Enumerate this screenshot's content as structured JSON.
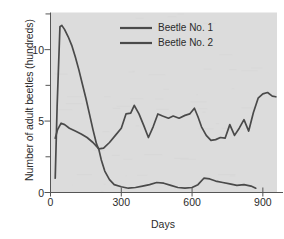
{
  "chart_data": {
    "type": "line",
    "title": "",
    "xlabel": "Days",
    "ylabel": "Number of adult beetles (hundreds)",
    "xlim": [
      0,
      960
    ],
    "ylim": [
      0,
      12.6
    ],
    "xticks": [
      0,
      300,
      600,
      900
    ],
    "xtick_labels": [
      "0",
      "300",
      "600",
      "900"
    ],
    "yticks": [
      0,
      5,
      10
    ],
    "ytick_labels": [
      "0",
      "5",
      "10"
    ],
    "yminor_ticks": [
      2.5,
      7.5,
      12.5
    ],
    "grid": false,
    "legend_position": "top-center",
    "plot_background": "#dcdcdc",
    "line_color": "#4a4a4a",
    "series": [
      {
        "name": "Beetle No. 1",
        "color": "#4a4a4a",
        "x": [
          20,
          28,
          40,
          48,
          60,
          75,
          90,
          105,
          120,
          135,
          150,
          165,
          180,
          195,
          205,
          215,
          230,
          250,
          270,
          300,
          330,
          360,
          390,
          420,
          450,
          480,
          510,
          540,
          570,
          600,
          625,
          650,
          675,
          700,
          730,
          760,
          790,
          820,
          850,
          870
        ],
        "y": [
          1.0,
          6.0,
          11.6,
          11.7,
          11.4,
          10.9,
          10.3,
          9.5,
          8.6,
          7.6,
          6.6,
          5.5,
          4.4,
          3.4,
          3.0,
          2.3,
          1.5,
          0.9,
          0.55,
          0.4,
          0.3,
          0.35,
          0.45,
          0.55,
          0.7,
          0.65,
          0.5,
          0.35,
          0.3,
          0.35,
          0.55,
          1.0,
          0.95,
          0.8,
          0.7,
          0.6,
          0.5,
          0.55,
          0.45,
          0.3
        ]
      },
      {
        "name": "Beetle No. 2",
        "color": "#4a4a4a",
        "x": [
          20,
          30,
          45,
          60,
          80,
          105,
          130,
          155,
          180,
          205,
          225,
          250,
          275,
          300,
          320,
          340,
          355,
          375,
          395,
          415,
          435,
          455,
          475,
          500,
          520,
          545,
          570,
          590,
          610,
          625,
          640,
          660,
          680,
          700,
          720,
          740,
          760,
          780,
          800,
          820,
          840,
          860,
          880,
          900,
          920,
          940,
          955
        ],
        "y": [
          3.8,
          4.4,
          4.85,
          4.75,
          4.5,
          4.3,
          4.1,
          3.85,
          3.5,
          3.05,
          3.1,
          3.5,
          4.0,
          4.5,
          5.5,
          5.55,
          6.1,
          5.5,
          4.7,
          3.85,
          4.6,
          5.5,
          5.35,
          5.2,
          5.35,
          5.2,
          5.4,
          5.5,
          5.9,
          5.3,
          4.6,
          4.0,
          3.65,
          3.7,
          3.85,
          3.8,
          4.75,
          4.0,
          4.5,
          5.1,
          4.3,
          5.6,
          6.6,
          6.9,
          7.0,
          6.75,
          6.7
        ]
      }
    ]
  },
  "legend": {
    "items": [
      {
        "label": "Beetle No. 1"
      },
      {
        "label": "Beetle No. 2"
      }
    ]
  }
}
